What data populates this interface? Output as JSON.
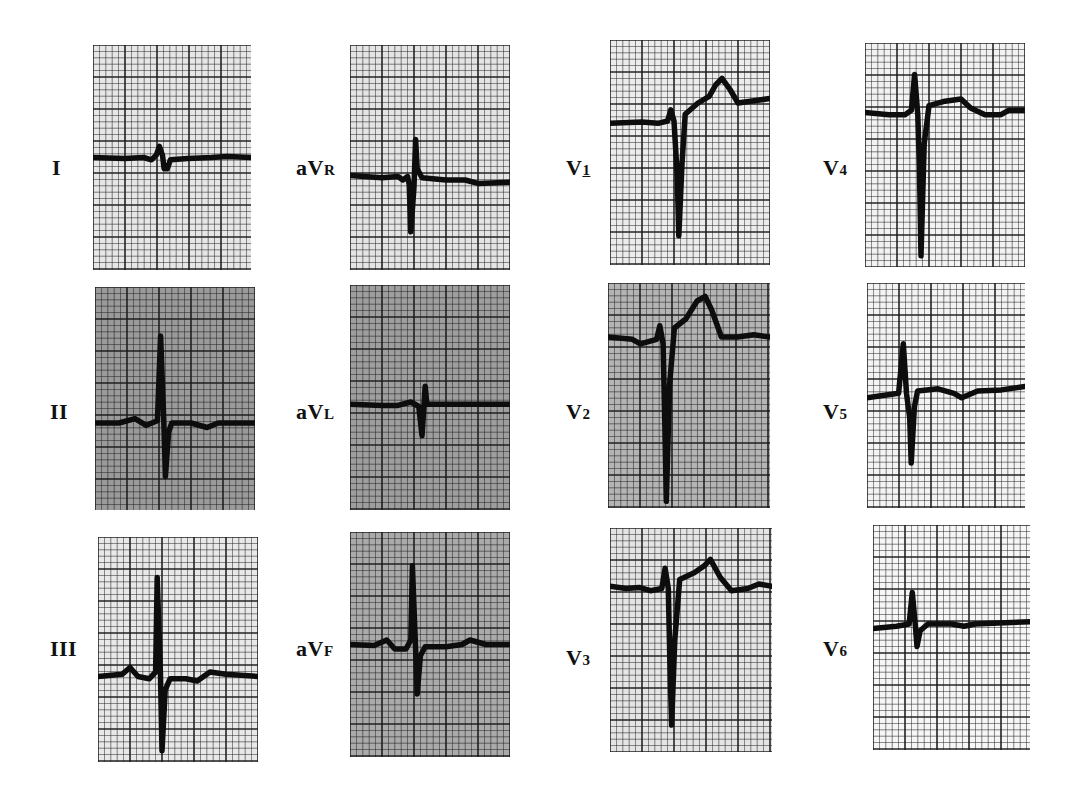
{
  "figure": {
    "layout": {
      "rows": 3,
      "columns": 4
    },
    "grid": {
      "small_square_px": 6.4,
      "large_every": 5,
      "line_color": "#1a1a1a"
    },
    "trace_color": "#0d0d0d"
  },
  "leads": [
    {
      "id": "I",
      "label_main": "I",
      "label_sub": "",
      "sub_underline": false,
      "label_x": 52,
      "label_y": 168,
      "box": {
        "x": 93,
        "y": 45,
        "w": 158,
        "h": 225
      },
      "bg": "#e6e6e6",
      "baseline": 0.5,
      "points": [
        [
          0,
          0.5
        ],
        [
          0.2,
          0.505
        ],
        [
          0.32,
          0.5
        ],
        [
          0.37,
          0.51
        ],
        [
          0.4,
          0.49
        ],
        [
          0.42,
          0.45
        ],
        [
          0.44,
          0.49
        ],
        [
          0.45,
          0.55
        ],
        [
          0.47,
          0.55
        ],
        [
          0.49,
          0.51
        ],
        [
          0.6,
          0.505
        ],
        [
          0.75,
          0.5
        ],
        [
          0.85,
          0.495
        ],
        [
          1,
          0.5
        ]
      ]
    },
    {
      "id": "aVR",
      "label_main": "aV",
      "label_sub": "R",
      "sub_underline": false,
      "label_x": 296,
      "label_y": 168,
      "box": {
        "x": 350,
        "y": 45,
        "w": 160,
        "h": 225
      },
      "bg": "#e4e4e4",
      "baseline": 0.58,
      "points": [
        [
          0,
          0.58
        ],
        [
          0.2,
          0.59
        ],
        [
          0.3,
          0.585
        ],
        [
          0.33,
          0.6
        ],
        [
          0.36,
          0.585
        ],
        [
          0.37,
          0.62
        ],
        [
          0.38,
          0.83
        ],
        [
          0.4,
          0.63
        ],
        [
          0.41,
          0.42
        ],
        [
          0.42,
          0.55
        ],
        [
          0.45,
          0.59
        ],
        [
          0.6,
          0.6
        ],
        [
          0.72,
          0.6
        ],
        [
          0.8,
          0.615
        ],
        [
          1,
          0.61
        ]
      ]
    },
    {
      "id": "V1",
      "label_main": "V",
      "label_sub": "1",
      "sub_underline": true,
      "label_x": 566,
      "label_y": 168,
      "box": {
        "x": 610,
        "y": 40,
        "w": 160,
        "h": 225
      },
      "bg": "#ececec",
      "baseline": 0.36,
      "points": [
        [
          0,
          0.37
        ],
        [
          0.2,
          0.365
        ],
        [
          0.3,
          0.37
        ],
        [
          0.36,
          0.36
        ],
        [
          0.38,
          0.31
        ],
        [
          0.4,
          0.36
        ],
        [
          0.42,
          0.6
        ],
        [
          0.43,
          0.87
        ],
        [
          0.45,
          0.55
        ],
        [
          0.47,
          0.33
        ],
        [
          0.55,
          0.28
        ],
        [
          0.62,
          0.25
        ],
        [
          0.66,
          0.2
        ],
        [
          0.7,
          0.17
        ],
        [
          0.75,
          0.22
        ],
        [
          0.8,
          0.28
        ],
        [
          0.9,
          0.27
        ],
        [
          1,
          0.26
        ]
      ]
    },
    {
      "id": "V4",
      "label_main": "V",
      "label_sub": "4",
      "sub_underline": false,
      "label_x": 823,
      "label_y": 168,
      "box": {
        "x": 865,
        "y": 43,
        "w": 160,
        "h": 224
      },
      "bg": "#f2f2f2",
      "baseline": 0.31,
      "points": [
        [
          0,
          0.31
        ],
        [
          0.15,
          0.32
        ],
        [
          0.25,
          0.32
        ],
        [
          0.29,
          0.3
        ],
        [
          0.31,
          0.14
        ],
        [
          0.33,
          0.32
        ],
        [
          0.34,
          0.55
        ],
        [
          0.35,
          0.95
        ],
        [
          0.37,
          0.45
        ],
        [
          0.4,
          0.28
        ],
        [
          0.5,
          0.26
        ],
        [
          0.6,
          0.25
        ],
        [
          0.66,
          0.29
        ],
        [
          0.75,
          0.32
        ],
        [
          0.85,
          0.32
        ],
        [
          0.9,
          0.3
        ],
        [
          1,
          0.3
        ]
      ]
    },
    {
      "id": "II",
      "label_main": "II",
      "label_sub": "",
      "sub_underline": false,
      "label_x": 50,
      "label_y": 412,
      "box": {
        "x": 95,
        "y": 287,
        "w": 160,
        "h": 223
      },
      "bg": "#9a9a9a",
      "baseline": 0.6,
      "points": [
        [
          0,
          0.61
        ],
        [
          0.15,
          0.61
        ],
        [
          0.25,
          0.59
        ],
        [
          0.32,
          0.62
        ],
        [
          0.39,
          0.6
        ],
        [
          0.41,
          0.22
        ],
        [
          0.43,
          0.6
        ],
        [
          0.44,
          0.85
        ],
        [
          0.46,
          0.65
        ],
        [
          0.48,
          0.61
        ],
        [
          0.6,
          0.61
        ],
        [
          0.7,
          0.63
        ],
        [
          0.77,
          0.61
        ],
        [
          1,
          0.61
        ]
      ]
    },
    {
      "id": "aVL",
      "label_main": "aV",
      "label_sub": "L",
      "sub_underline": false,
      "label_x": 296,
      "label_y": 412,
      "box": {
        "x": 350,
        "y": 285,
        "w": 160,
        "h": 225
      },
      "bg": "#9e9e9e",
      "baseline": 0.53,
      "points": [
        [
          0,
          0.53
        ],
        [
          0.2,
          0.535
        ],
        [
          0.3,
          0.535
        ],
        [
          0.38,
          0.52
        ],
        [
          0.43,
          0.54
        ],
        [
          0.45,
          0.67
        ],
        [
          0.47,
          0.45
        ],
        [
          0.48,
          0.53
        ],
        [
          0.6,
          0.53
        ],
        [
          1,
          0.53
        ]
      ]
    },
    {
      "id": "V2",
      "label_main": "V",
      "label_sub": "2",
      "sub_underline": false,
      "label_x": 566,
      "label_y": 412,
      "box": {
        "x": 608,
        "y": 283,
        "w": 162,
        "h": 225
      },
      "bg": "#b4b4b4",
      "baseline": 0.25,
      "points": [
        [
          0,
          0.24
        ],
        [
          0.15,
          0.25
        ],
        [
          0.2,
          0.27
        ],
        [
          0.3,
          0.25
        ],
        [
          0.32,
          0.19
        ],
        [
          0.34,
          0.27
        ],
        [
          0.35,
          0.6
        ],
        [
          0.36,
          0.97
        ],
        [
          0.38,
          0.45
        ],
        [
          0.41,
          0.2
        ],
        [
          0.48,
          0.16
        ],
        [
          0.55,
          0.08
        ],
        [
          0.6,
          0.06
        ],
        [
          0.64,
          0.12
        ],
        [
          0.7,
          0.24
        ],
        [
          0.8,
          0.24
        ],
        [
          0.9,
          0.23
        ],
        [
          1,
          0.24
        ]
      ]
    },
    {
      "id": "V5",
      "label_main": "V",
      "label_sub": "5",
      "sub_underline": false,
      "label_x": 823,
      "label_y": 412,
      "box": {
        "x": 867,
        "y": 283,
        "w": 158,
        "h": 225
      },
      "bg": "#f3f3f3",
      "baseline": 0.51,
      "points": [
        [
          0,
          0.51
        ],
        [
          0.1,
          0.5
        ],
        [
          0.2,
          0.49
        ],
        [
          0.23,
          0.27
        ],
        [
          0.25,
          0.49
        ],
        [
          0.27,
          0.6
        ],
        [
          0.28,
          0.8
        ],
        [
          0.3,
          0.55
        ],
        [
          0.32,
          0.48
        ],
        [
          0.45,
          0.47
        ],
        [
          0.55,
          0.49
        ],
        [
          0.6,
          0.51
        ],
        [
          0.7,
          0.48
        ],
        [
          0.85,
          0.475
        ],
        [
          1,
          0.46
        ]
      ]
    },
    {
      "id": "III",
      "label_main": "III",
      "label_sub": "",
      "sub_underline": false,
      "label_x": 50,
      "label_y": 649,
      "box": {
        "x": 98,
        "y": 537,
        "w": 160,
        "h": 225
      },
      "bg": "#e8e8e8",
      "baseline": 0.62,
      "points": [
        [
          0,
          0.62
        ],
        [
          0.15,
          0.61
        ],
        [
          0.2,
          0.58
        ],
        [
          0.25,
          0.62
        ],
        [
          0.32,
          0.63
        ],
        [
          0.36,
          0.6
        ],
        [
          0.37,
          0.18
        ],
        [
          0.39,
          0.6
        ],
        [
          0.4,
          0.95
        ],
        [
          0.42,
          0.68
        ],
        [
          0.45,
          0.63
        ],
        [
          0.55,
          0.63
        ],
        [
          0.62,
          0.64
        ],
        [
          0.7,
          0.6
        ],
        [
          0.8,
          0.61
        ],
        [
          1,
          0.62
        ]
      ]
    },
    {
      "id": "aVF",
      "label_main": "aV",
      "label_sub": "F",
      "sub_underline": false,
      "label_x": 296,
      "label_y": 649,
      "box": {
        "x": 350,
        "y": 532,
        "w": 160,
        "h": 225
      },
      "bg": "#aaaaaa",
      "baseline": 0.5,
      "points": [
        [
          0,
          0.5
        ],
        [
          0.15,
          0.505
        ],
        [
          0.23,
          0.48
        ],
        [
          0.28,
          0.52
        ],
        [
          0.35,
          0.52
        ],
        [
          0.38,
          0.48
        ],
        [
          0.39,
          0.15
        ],
        [
          0.41,
          0.52
        ],
        [
          0.42,
          0.72
        ],
        [
          0.44,
          0.55
        ],
        [
          0.47,
          0.51
        ],
        [
          0.6,
          0.51
        ],
        [
          0.7,
          0.5
        ],
        [
          0.75,
          0.48
        ],
        [
          0.85,
          0.5
        ],
        [
          1,
          0.5
        ]
      ]
    },
    {
      "id": "V3",
      "label_main": "V",
      "label_sub": "3",
      "sub_underline": false,
      "label_x": 566,
      "label_y": 658,
      "box": {
        "x": 610,
        "y": 528,
        "w": 162,
        "h": 224
      },
      "bg": "#e4e4e4",
      "baseline": 0.26,
      "points": [
        [
          0,
          0.26
        ],
        [
          0.1,
          0.27
        ],
        [
          0.18,
          0.265
        ],
        [
          0.25,
          0.28
        ],
        [
          0.32,
          0.27
        ],
        [
          0.34,
          0.18
        ],
        [
          0.36,
          0.27
        ],
        [
          0.37,
          0.6
        ],
        [
          0.38,
          0.88
        ],
        [
          0.4,
          0.5
        ],
        [
          0.43,
          0.23
        ],
        [
          0.52,
          0.2
        ],
        [
          0.58,
          0.17
        ],
        [
          0.62,
          0.14
        ],
        [
          0.68,
          0.22
        ],
        [
          0.75,
          0.28
        ],
        [
          0.85,
          0.27
        ],
        [
          0.92,
          0.25
        ],
        [
          1,
          0.26
        ]
      ]
    },
    {
      "id": "V6",
      "label_main": "V",
      "label_sub": "6",
      "sub_underline": false,
      "label_x": 823,
      "label_y": 649,
      "box": {
        "x": 873,
        "y": 525,
        "w": 157,
        "h": 225
      },
      "bg": "#f6f6f6",
      "baseline": 0.45,
      "points": [
        [
          0,
          0.46
        ],
        [
          0.15,
          0.45
        ],
        [
          0.23,
          0.44
        ],
        [
          0.25,
          0.3
        ],
        [
          0.27,
          0.45
        ],
        [
          0.28,
          0.54
        ],
        [
          0.3,
          0.47
        ],
        [
          0.35,
          0.44
        ],
        [
          0.5,
          0.44
        ],
        [
          0.58,
          0.45
        ],
        [
          0.65,
          0.44
        ],
        [
          0.8,
          0.435
        ],
        [
          1,
          0.43
        ]
      ]
    }
  ]
}
